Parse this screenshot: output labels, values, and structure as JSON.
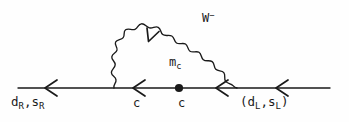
{
  "diagram": {
    "type": "feynman-diagram",
    "colors": {
      "background": "#fefefe",
      "stroke": "#1a1a1a",
      "text": "#1a1a1a"
    },
    "labels": {
      "incoming_fermion": {
        "base": "d",
        "sub": "R",
        "sep": ",",
        "base2": "s",
        "sub2": "R"
      },
      "outgoing_fermion": {
        "open": "(",
        "base": "d",
        "sub": "L",
        "sep": ",",
        "base2": "s",
        "sub2": "L",
        "close": ")"
      },
      "internal_quark_left": "c",
      "internal_quark_right": "c",
      "mass_insertion": {
        "base": "m",
        "sub": "c"
      },
      "gauge_boson": {
        "base": "W",
        "sup": "−"
      }
    },
    "elements": {
      "fermion_line_name": "horizontal fermion propagator",
      "boson_arc_name": "wavy W boson propagator",
      "vertex_dot_name": "mass insertion vertex",
      "arrow_count_fermion": 4,
      "arrow_count_boson": 1
    }
  }
}
